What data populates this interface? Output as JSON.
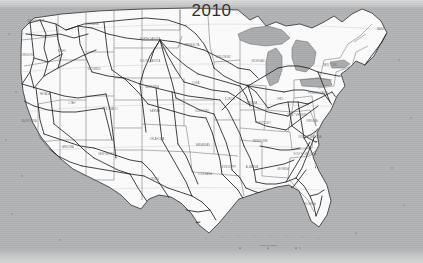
{
  "figure": {
    "title": "2010",
    "type": "map",
    "background_color": "#b0b1b2",
    "land_color": "#fbfbfb",
    "water_color": "#a9aaab",
    "network_color": "#1b1b1d",
    "border_color": "#5a5a5c"
  },
  "state_labels": [
    {
      "name": "WASHINGTON",
      "x": 36,
      "y": 22
    },
    {
      "name": "OREGON",
      "x": 27,
      "y": 56
    },
    {
      "name": "IDAHO",
      "x": 62,
      "y": 52
    },
    {
      "name": "MONTANA",
      "x": 92,
      "y": 25
    },
    {
      "name": "WYOMING",
      "x": 94,
      "y": 70
    },
    {
      "name": "NEVADA",
      "x": 45,
      "y": 95
    },
    {
      "name": "CALIFORNIA",
      "x": 29,
      "y": 122
    },
    {
      "name": "UTAH",
      "x": 72,
      "y": 104
    },
    {
      "name": "ARIZONA",
      "x": 68,
      "y": 148
    },
    {
      "name": "COLORADO",
      "x": 110,
      "y": 110
    },
    {
      "name": "NEW MEXICO",
      "x": 107,
      "y": 155
    },
    {
      "name": "NORTH DAKOTA",
      "x": 150,
      "y": 40
    },
    {
      "name": "SOUTH DAKOTA",
      "x": 150,
      "y": 62
    },
    {
      "name": "NEBRASKA",
      "x": 152,
      "y": 88
    },
    {
      "name": "KANSAS",
      "x": 155,
      "y": 112
    },
    {
      "name": "OKLAHOMA",
      "x": 157,
      "y": 140
    },
    {
      "name": "TEXAS",
      "x": 155,
      "y": 180
    },
    {
      "name": "MINNESOTA",
      "x": 192,
      "y": 46
    },
    {
      "name": "IOWA",
      "x": 196,
      "y": 84
    },
    {
      "name": "MISSOURI",
      "x": 202,
      "y": 112
    },
    {
      "name": "ARKANSAS",
      "x": 203,
      "y": 146
    },
    {
      "name": "LOUISIANA",
      "x": 205,
      "y": 175
    },
    {
      "name": "WISCONSIN",
      "x": 223,
      "y": 58
    },
    {
      "name": "ILLINOIS",
      "x": 230,
      "y": 100
    },
    {
      "name": "MISSISSIPPI",
      "x": 228,
      "y": 168
    },
    {
      "name": "MICHIGAN",
      "x": 258,
      "y": 62
    },
    {
      "name": "INDIANA",
      "x": 252,
      "y": 104
    },
    {
      "name": "KENTUCKY",
      "x": 264,
      "y": 124
    },
    {
      "name": "TENNESSEE",
      "x": 260,
      "y": 142
    },
    {
      "name": "ALABAMA",
      "x": 252,
      "y": 168
    },
    {
      "name": "OHIO",
      "x": 280,
      "y": 100
    },
    {
      "name": "WEST VIRGINIA",
      "x": 297,
      "y": 116
    },
    {
      "name": "GEORGIA",
      "x": 283,
      "y": 170
    },
    {
      "name": "FLORIDA",
      "x": 310,
      "y": 205
    },
    {
      "name": "SOUTH CAROLINA",
      "x": 305,
      "y": 155
    },
    {
      "name": "NORTH CAROLINA",
      "x": 310,
      "y": 138
    },
    {
      "name": "VIRGINIA",
      "x": 312,
      "y": 122
    },
    {
      "name": "PENNSYLVANIA",
      "x": 318,
      "y": 94
    },
    {
      "name": "NEW YORK",
      "x": 330,
      "y": 66
    },
    {
      "name": "MAINE",
      "x": 381,
      "y": 30
    }
  ],
  "scale_bar": {
    "label": "0       200      400 Miles",
    "tick_labels": [
      "0",
      "200",
      "400"
    ]
  },
  "lakes": [
    "Lake Superior",
    "Lake Michigan",
    "Lake Huron",
    "Lake Erie",
    "Lake Ontario"
  ]
}
